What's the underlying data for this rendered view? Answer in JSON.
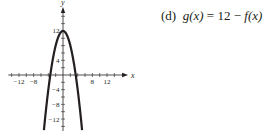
{
  "chart_data": {
    "type": "line",
    "title": "",
    "caption_part": "(d)",
    "function_label": "g(x) = 12 − f(x)",
    "xlabel": "x",
    "ylabel": "y",
    "xlim": [
      -16,
      18
    ],
    "ylim": [
      -15,
      19
    ],
    "x_tick_step": 2,
    "y_tick_step": 2,
    "x_tick_labels": [
      "-12",
      "-8",
      "8",
      "12"
    ],
    "y_tick_labels": [
      "12",
      "4",
      "-4",
      "-8",
      "-12"
    ],
    "grid": false,
    "series": [
      {
        "name": "g(x)",
        "expression": "12 - x^2",
        "x": [
          -5.2,
          -4,
          -3,
          -2,
          -1,
          0,
          1,
          2,
          3,
          4,
          5.2
        ],
        "y": [
          -15,
          -4,
          3,
          8,
          11,
          12,
          11,
          8,
          3,
          -4,
          -15
        ]
      }
    ]
  },
  "caption": {
    "part": "(d)",
    "lhs": "g(x)",
    "eq": "=",
    "rhs_num": "12",
    "minus": "−",
    "rhs_fn": "f(x)"
  }
}
